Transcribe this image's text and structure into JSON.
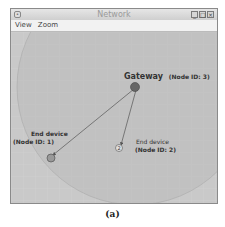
{
  "window": {
    "title": "Network",
    "buttons": {
      "minimize": "_",
      "maximize": "□",
      "close": "×"
    }
  },
  "menubar": {
    "items": [
      {
        "label": "View"
      },
      {
        "label": "Zoom"
      }
    ]
  },
  "canvas": {
    "nodes": [
      {
        "role": "Gateway",
        "id_label": "(Node ID: 3)",
        "id": 3
      },
      {
        "role": "End device",
        "id_label": "(Node ID: 1)",
        "id": 1
      },
      {
        "role": "End device",
        "id_label": "(Node ID: 2)",
        "id": 2,
        "marker": "2"
      }
    ],
    "colors": {
      "background": "#c9c9c9",
      "range": "#bdbdbd",
      "gateway": "#666666",
      "link": "#555555"
    }
  },
  "caption": "(a)"
}
